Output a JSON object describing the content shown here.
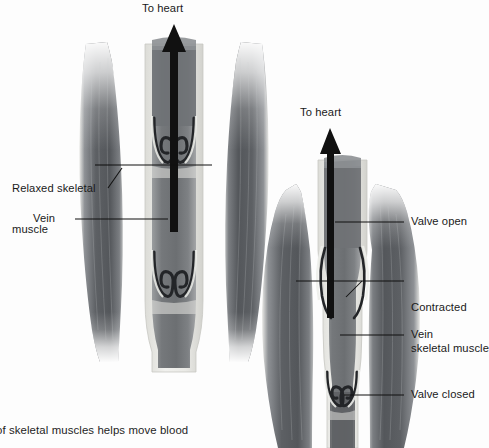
{
  "figure": {
    "kind": "anatomy-diagram",
    "colors": {
      "background": "#fdfdfd",
      "muscle_dark": "#55585c",
      "muscle_mid": "#6e7276",
      "muscle_light": "#f2f2f0",
      "vein_wall": "#e8e8e4",
      "vein_lumen": "#7a7d80",
      "arrow": "#111111",
      "label_text": "#1a1a1a",
      "leader_line": "#111111"
    }
  },
  "panels": [
    {
      "id": "relaxed",
      "heading": "To heart",
      "state": "relaxed",
      "labels": [
        {
          "id": "relaxed-skeletal-muscle",
          "line1": "Relaxed skeletal",
          "line2": "muscle"
        },
        {
          "id": "vein",
          "line1": "Vein",
          "line2": ""
        }
      ],
      "valves": [
        {
          "id": "upper-valve",
          "state": "open"
        },
        {
          "id": "lower-valve",
          "state": "open"
        }
      ]
    },
    {
      "id": "contracted",
      "heading": "To heart",
      "state": "contracted",
      "labels": [
        {
          "id": "valve-open",
          "line1": "Valve open",
          "line2": ""
        },
        {
          "id": "contracted-skeletal-muscle",
          "line1": "Contracted",
          "line2": "skeletal muscle"
        },
        {
          "id": "vein",
          "line1": "Vein",
          "line2": ""
        },
        {
          "id": "valve-closed",
          "line1": "Valve closed",
          "line2": ""
        }
      ],
      "valves": [
        {
          "id": "upper-valve",
          "state": "open"
        },
        {
          "id": "lower-valve",
          "state": "closed"
        }
      ]
    }
  ],
  "caption": {
    "text": "of skeletal muscles helps move blood",
    "clipped_left": true
  }
}
